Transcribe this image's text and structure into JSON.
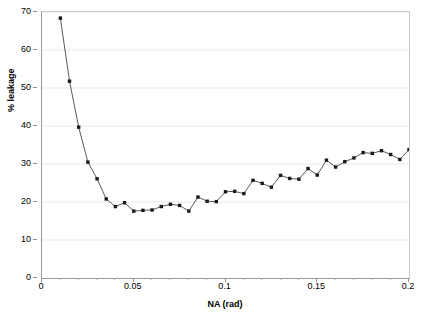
{
  "chart_data": {
    "type": "line",
    "title": "",
    "subtitle": "",
    "xlabel": "NA (rad)",
    "ylabel": "% leakage",
    "xlim": [
      0,
      0.2
    ],
    "ylim": [
      0,
      70
    ],
    "xticks": [
      0,
      0.05,
      0.1,
      0.15,
      0.2
    ],
    "xtick_labels": [
      "0",
      "0.05",
      "0.1",
      "0.15",
      "0.2"
    ],
    "yticks": [
      0,
      10,
      20,
      30,
      40,
      50,
      60,
      70
    ],
    "ytick_labels": [
      "0",
      "10",
      "20",
      "30",
      "40",
      "50",
      "60",
      "70"
    ],
    "grid": "horizontal",
    "legend": "none",
    "marker": "square",
    "marker_color": "#1a1a1a",
    "line_color": "#595959",
    "grid_color": "#e8e8e8",
    "frame_color": "#9a9a9a",
    "x": [
      0.01,
      0.015,
      0.02,
      0.025,
      0.03,
      0.035,
      0.04,
      0.045,
      0.05,
      0.055,
      0.06,
      0.065,
      0.07,
      0.075,
      0.08,
      0.085,
      0.09,
      0.095,
      0.1,
      0.105,
      0.11,
      0.115,
      0.12,
      0.125,
      0.13,
      0.135,
      0.14,
      0.145,
      0.15,
      0.155,
      0.16,
      0.165,
      0.17,
      0.175,
      0.18,
      0.185,
      0.19,
      0.195,
      0.2
    ],
    "y": [
      68.4,
      51.8,
      39.7,
      30.5,
      26.1,
      20.8,
      18.8,
      19.8,
      17.6,
      17.8,
      17.9,
      18.8,
      19.4,
      19.1,
      17.6,
      21.3,
      20.2,
      20.1,
      22.7,
      22.8,
      22.2,
      25.7,
      24.9,
      23.9,
      27.0,
      26.2,
      26.0,
      28.8,
      27.1,
      31.0,
      29.2,
      30.6,
      31.6,
      33.0,
      32.8,
      33.5,
      32.5,
      31.2,
      33.8
    ],
    "series": [
      {
        "name": "% leakage",
        "values": [
          68.4,
          51.8,
          39.7,
          30.5,
          26.1,
          20.8,
          18.8,
          19.8,
          17.6,
          17.8,
          17.9,
          18.8,
          19.4,
          19.1,
          17.6,
          21.3,
          20.2,
          20.1,
          22.7,
          22.8,
          22.2,
          25.7,
          24.9,
          23.9,
          27.0,
          26.2,
          26.0,
          28.8,
          27.1,
          31.0,
          29.2,
          30.6,
          31.6,
          33.0,
          32.8,
          33.5,
          32.5,
          31.2,
          33.8
        ]
      }
    ]
  }
}
